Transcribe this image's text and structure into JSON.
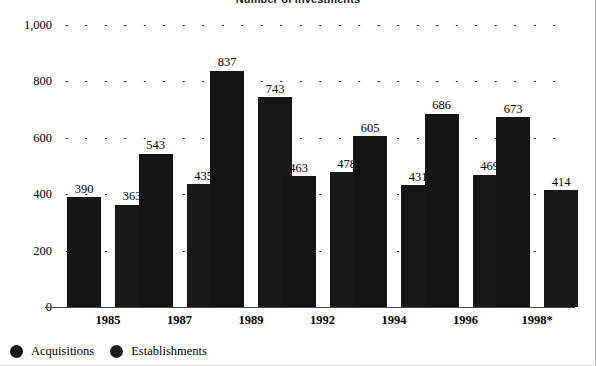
{
  "chart_data": {
    "type": "bar",
    "title": "Number of Investments",
    "xlabel": "",
    "ylabel": "",
    "ylim": [
      0,
      1000
    ],
    "ytick_labels": [
      "0",
      "200",
      "400",
      "600",
      "800",
      "1,000"
    ],
    "ytick_values": [
      0,
      200,
      400,
      600,
      800,
      1000
    ],
    "grid": "dotted-horizontal",
    "legend_position": "bottom-left",
    "categories": [
      "1985",
      "1987",
      "1989",
      "1992",
      "1994",
      "1996",
      "1998*"
    ],
    "series": [
      {
        "name": "Acquisitions",
        "color": "#141414",
        "values": [
          390,
          543,
          837,
          463,
          605,
          686,
          673
        ]
      },
      {
        "name": "Establishments",
        "color": "#171717",
        "values": [
          363,
          435,
          743,
          478,
          431,
          469,
          414
        ]
      }
    ]
  },
  "legend": {
    "items": [
      {
        "label": "Acquisitions",
        "swatch": "circle-filled-dark"
      },
      {
        "label": "Establishments",
        "swatch": "circle-filled-dark"
      }
    ]
  }
}
